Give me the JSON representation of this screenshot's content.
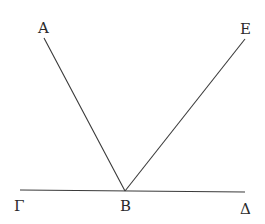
{
  "diagram": {
    "labels": {
      "A": "A",
      "E": "E",
      "Gamma": "Γ",
      "B": "B",
      "Delta": "Δ"
    },
    "segments": [
      {
        "name": "segment-AB",
        "from": "A",
        "to": "B"
      },
      {
        "name": "segment-EB",
        "from": "E",
        "to": "B"
      },
      {
        "name": "segment-GammaDelta",
        "from": "Γ",
        "to": "Δ"
      }
    ],
    "line_color": "#3a3a3a"
  }
}
